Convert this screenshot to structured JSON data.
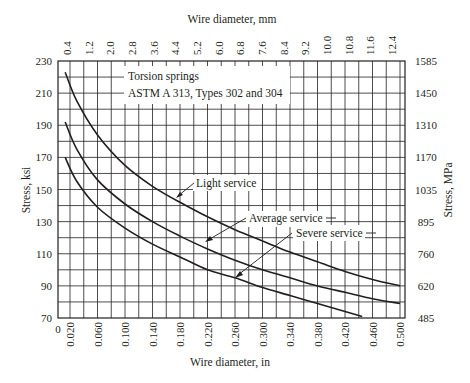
{
  "chart_data": {
    "type": "line",
    "title": "Torsion springs",
    "subtitle": "ASTM A 313, Types 302 and 304",
    "xlabel": "Wire diameter, in",
    "x2label": "Wire diameter, mm",
    "ylabel": "Stress, ksi",
    "y2label": "Stress, MPa",
    "xlim": [
      0,
      0.507
    ],
    "ylim": [
      70,
      230
    ],
    "grid": true,
    "x_ticks": [
      "0.020",
      "0.060",
      "0.100",
      "0.140",
      "0.180",
      "0.220",
      "0.260",
      "0.300",
      "0.340",
      "0.380",
      "0.420",
      "0.460",
      "0.500"
    ],
    "x_origin_label": "0",
    "x2_ticks": [
      "0.4",
      "1.2",
      "2.0",
      "2.8",
      "3.6",
      "4.4",
      "5.2",
      "6.0",
      "6.8",
      "7.6",
      "8.4",
      "9.2",
      "10.0",
      "10.8",
      "11.6",
      "12.4"
    ],
    "y_ticks": [
      "230",
      "210",
      "190",
      "170",
      "150",
      "130",
      "110",
      "90",
      "70"
    ],
    "y2_ticks": [
      "1585",
      "1450",
      "1310",
      "1170",
      "1035",
      "895",
      "760",
      "620",
      "485"
    ],
    "series": [
      {
        "name": "Light service",
        "x": [
          0.013,
          0.03,
          0.06,
          0.1,
          0.14,
          0.18,
          0.22,
          0.26,
          0.3,
          0.34,
          0.38,
          0.42,
          0.46,
          0.5
        ],
        "y": [
          223,
          205,
          184,
          165,
          152,
          142,
          133,
          125,
          118,
          111,
          105,
          99,
          94,
          90
        ]
      },
      {
        "name": "Average service",
        "x": [
          0.013,
          0.03,
          0.06,
          0.1,
          0.14,
          0.18,
          0.22,
          0.26,
          0.3,
          0.34,
          0.38,
          0.42,
          0.46,
          0.5
        ],
        "y": [
          192,
          175,
          156,
          141,
          130,
          121,
          113,
          106,
          100,
          95,
          90,
          86,
          82,
          79
        ]
      },
      {
        "name": "Severe service",
        "x": [
          0.013,
          0.03,
          0.06,
          0.1,
          0.14,
          0.18,
          0.22,
          0.26,
          0.3,
          0.34,
          0.38,
          0.42,
          0.445
        ],
        "y": [
          170,
          155,
          139,
          126,
          116,
          108,
          100,
          95,
          89,
          84,
          79,
          74,
          71
        ]
      }
    ],
    "annotations": [
      {
        "text": "Light service",
        "points_to": "Light service"
      },
      {
        "text": "Average service",
        "points_to": "Average service"
      },
      {
        "text": "Severe service",
        "points_to": "Severe service"
      }
    ]
  }
}
